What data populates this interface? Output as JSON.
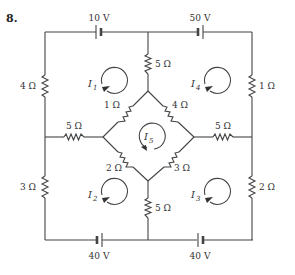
{
  "problem_number": "8.",
  "batteries": {
    "top_left": "10 V",
    "top_right": "50 V",
    "bottom_left": "40 V",
    "bottom_right": "40 V"
  },
  "resistors": {
    "left_upper": "4 Ω",
    "left_lower": "3 Ω",
    "right_upper": "1 Ω",
    "right_lower": "2 Ω",
    "center_top": "5 Ω",
    "center_bottom": "5 Ω",
    "mid_left": "5 Ω",
    "mid_right": "5 Ω",
    "diamond_upper_left": "1 Ω",
    "diamond_upper_right": "4 Ω",
    "diamond_lower_left": "2 Ω",
    "diamond_lower_right": "3 Ω"
  },
  "loop_currents": [
    {
      "name": "I",
      "sub": "1",
      "direction": "clockwise"
    },
    {
      "name": "I",
      "sub": "2",
      "direction": "clockwise"
    },
    {
      "name": "I",
      "sub": "3",
      "direction": "clockwise"
    },
    {
      "name": "I",
      "sub": "4",
      "direction": "clockwise"
    },
    {
      "name": "I",
      "sub": "5",
      "direction": "clockwise"
    }
  ]
}
